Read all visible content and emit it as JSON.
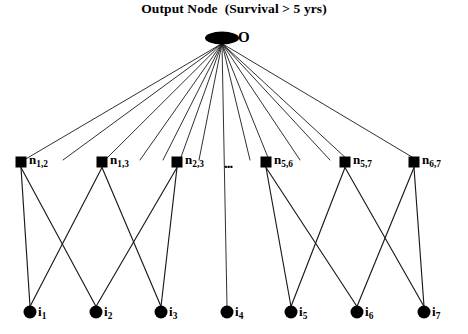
{
  "title": "Output Node  (Survival > 5 yrs)",
  "diagram": {
    "kind": "neural-network-graph",
    "colors": {
      "ink": "#000000",
      "background": "#ffffff",
      "edge": "#1a1a1a"
    },
    "output_node": {
      "id": "O",
      "label": "O",
      "shape": "ellipse",
      "x": 222,
      "y": 38,
      "rx": 17,
      "ry": 6.5,
      "label_x": 238,
      "label_y": 30
    },
    "hidden_layer": {
      "shape": "square",
      "size": 11,
      "y": 162,
      "ellipsis": "...",
      "ellipsis_x": 224,
      "ellipsis_y": 156,
      "nodes": [
        {
          "id": "n12",
          "base": "n",
          "sub": "1,2",
          "x": 21,
          "label_x": 29,
          "label_y": 153
        },
        {
          "id": "n13",
          "base": "n",
          "sub": "1,3",
          "x": 102,
          "label_x": 110,
          "label_y": 153
        },
        {
          "id": "n23",
          "base": "n",
          "sub": "2,3",
          "x": 177,
          "label_x": 185,
          "label_y": 153
        },
        {
          "id": "n56",
          "base": "n",
          "sub": "5,6",
          "x": 266,
          "label_x": 274,
          "label_y": 153
        },
        {
          "id": "n57",
          "base": "n",
          "sub": "5,7",
          "x": 345,
          "label_x": 353,
          "label_y": 153
        },
        {
          "id": "n67",
          "base": "n",
          "sub": "6,7",
          "x": 414,
          "label_x": 422,
          "label_y": 153
        }
      ]
    },
    "input_layer": {
      "shape": "circle",
      "radius": 6.5,
      "y": 312,
      "nodes": [
        {
          "id": "i1",
          "base": "i",
          "sub": "1",
          "x": 30,
          "label_x": 38,
          "label_y": 305
        },
        {
          "id": "i2",
          "base": "i",
          "sub": "2",
          "x": 96,
          "label_x": 104,
          "label_y": 305
        },
        {
          "id": "i3",
          "base": "i",
          "sub": "3",
          "x": 161,
          "label_x": 169,
          "label_y": 305
        },
        {
          "id": "i4",
          "base": "i",
          "sub": "4",
          "x": 227,
          "label_x": 235,
          "label_y": 305
        },
        {
          "id": "i5",
          "base": "i",
          "sub": "5",
          "x": 291,
          "label_x": 299,
          "label_y": 305
        },
        {
          "id": "i6",
          "base": "i",
          "sub": "6",
          "x": 357,
          "label_x": 365,
          "label_y": 305
        },
        {
          "id": "i7",
          "base": "i",
          "sub": "7",
          "x": 424,
          "label_x": 432,
          "label_y": 305
        }
      ]
    },
    "output_edges_fan": [
      {
        "from": "O",
        "to_x": 24,
        "to_y": 160
      },
      {
        "from": "O",
        "to_x": 63,
        "to_y": 160
      },
      {
        "from": "O",
        "to_x": 105,
        "to_y": 160
      },
      {
        "from": "O",
        "to_x": 140,
        "to_y": 160
      },
      {
        "from": "O",
        "to_x": 163,
        "to_y": 160
      },
      {
        "from": "O",
        "to_x": 180,
        "to_y": 160
      },
      {
        "from": "O",
        "to_x": 199,
        "to_y": 160
      },
      {
        "from": "O",
        "to_x": 227,
        "to_y": 306
      },
      {
        "from": "O",
        "to_x": 250,
        "to_y": 160
      },
      {
        "from": "O",
        "to_x": 269,
        "to_y": 160
      },
      {
        "from": "O",
        "to_x": 300,
        "to_y": 160
      },
      {
        "from": "O",
        "to_x": 330,
        "to_y": 160
      },
      {
        "from": "O",
        "to_x": 348,
        "to_y": 160
      },
      {
        "from": "O",
        "to_x": 417,
        "to_y": 160
      }
    ],
    "hidden_to_input_edges": [
      {
        "from": "n12",
        "to": "i1"
      },
      {
        "from": "n12",
        "to": "i2"
      },
      {
        "from": "n13",
        "to": "i1"
      },
      {
        "from": "n13",
        "to": "i3"
      },
      {
        "from": "n23",
        "to": "i2"
      },
      {
        "from": "n23",
        "to": "i3"
      },
      {
        "from": "n56",
        "to": "i5"
      },
      {
        "from": "n56",
        "to": "i6"
      },
      {
        "from": "n57",
        "to": "i5"
      },
      {
        "from": "n57",
        "to": "i7"
      },
      {
        "from": "n67",
        "to": "i6"
      },
      {
        "from": "n67",
        "to": "i7"
      }
    ]
  }
}
